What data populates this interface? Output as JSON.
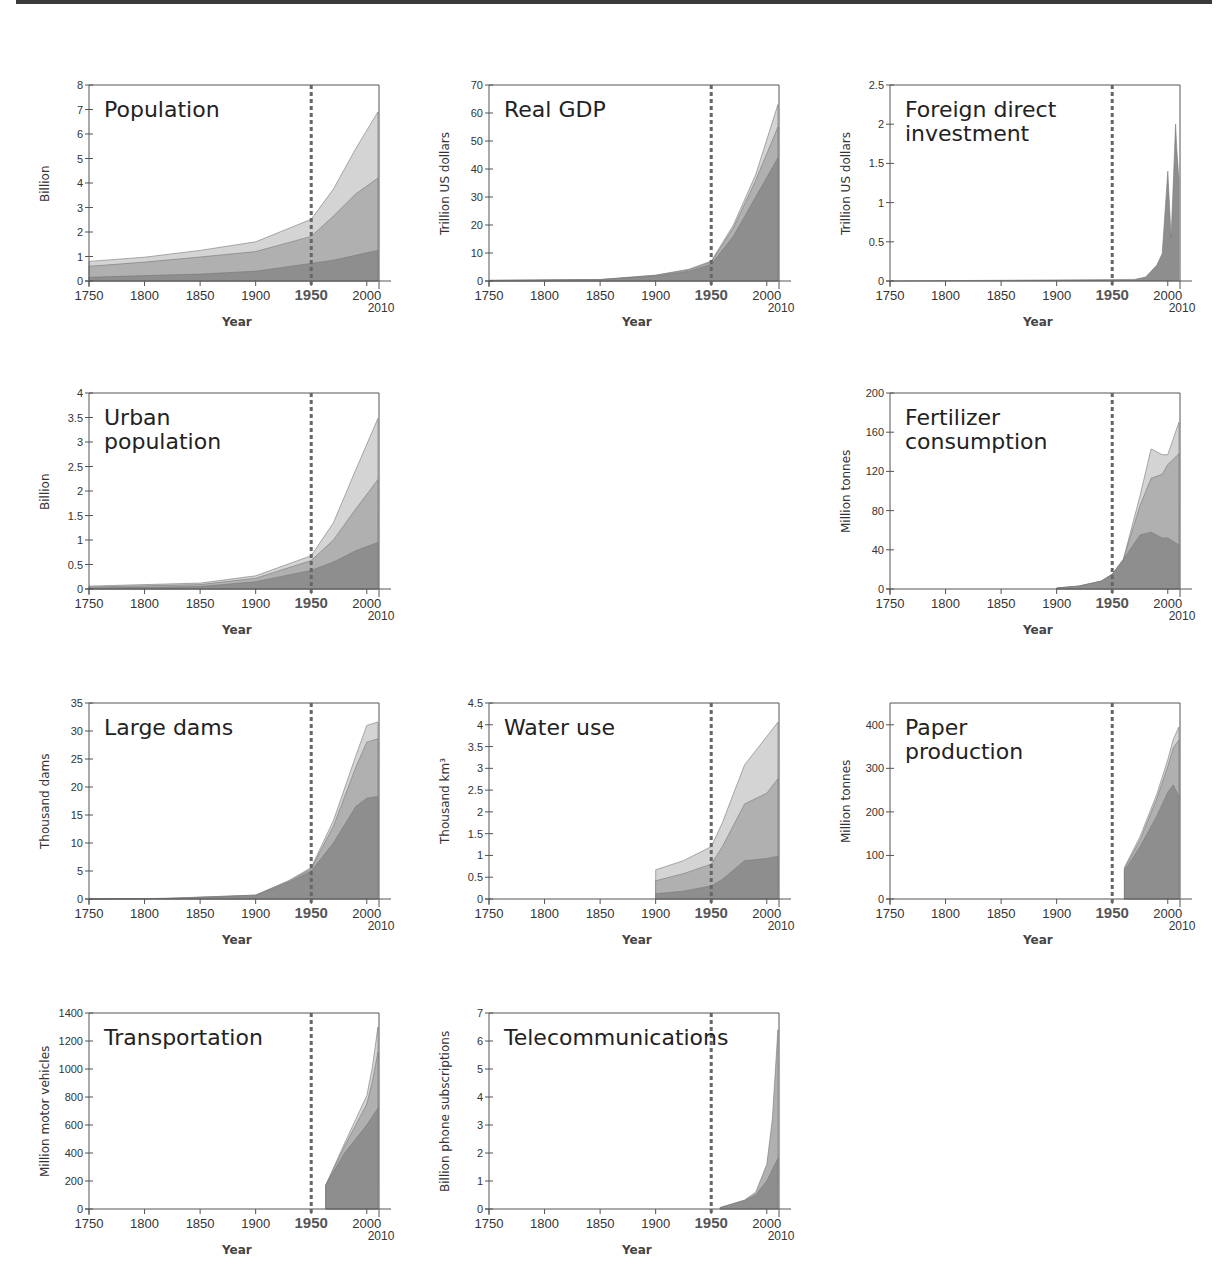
{
  "figure": {
    "colors": {
      "layer_dark": "#8e8e8e",
      "layer_mid": "#b0b0b0",
      "layer_light": "#d4d4d4",
      "axis": "#555555",
      "marker_1950": "#666666",
      "text": "#333333"
    },
    "x_axis": {
      "label": "Year",
      "ticks": [
        "1750",
        "1800",
        "1850",
        "1900",
        "1950",
        "2000"
      ],
      "end_label": "2010",
      "range": [
        1750,
        2010
      ],
      "highlight_year": 1950
    }
  },
  "chart_data": [
    {
      "id": "population",
      "type": "area",
      "stacked": true,
      "title": "Population",
      "xlabel": "Year",
      "ylabel": "Billion",
      "ylim": [
        0,
        8
      ],
      "yticks": [
        "0",
        "1",
        "2",
        "3",
        "4",
        "5",
        "6",
        "7",
        "8"
      ],
      "x": [
        1750,
        1800,
        1850,
        1900,
        1950,
        1970,
        1990,
        2010
      ],
      "series": [
        {
          "name": "layer1",
          "values": [
            0.15,
            0.22,
            0.28,
            0.4,
            0.72,
            0.85,
            1.05,
            1.25
          ]
        },
        {
          "name": "layer2",
          "values": [
            0.45,
            0.55,
            0.7,
            0.8,
            1.1,
            1.8,
            2.5,
            2.95
          ]
        },
        {
          "name": "layer3",
          "values": [
            0.2,
            0.2,
            0.27,
            0.4,
            0.7,
            1.1,
            1.85,
            2.7
          ]
        }
      ],
      "vline": 1950,
      "grid": false
    },
    {
      "id": "real-gdp",
      "type": "area",
      "stacked": true,
      "title": "Real GDP",
      "xlabel": "Year",
      "ylabel": "Trillion US dollars",
      "ylim": [
        0,
        70
      ],
      "yticks": [
        "0",
        "10",
        "20",
        "30",
        "40",
        "50",
        "60",
        "70"
      ],
      "x": [
        1750,
        1850,
        1900,
        1930,
        1950,
        1970,
        1990,
        2010
      ],
      "series": [
        {
          "name": "layer1",
          "values": [
            0.2,
            0.5,
            1.8,
            3.5,
            6,
            16,
            30,
            44
          ]
        },
        {
          "name": "layer2",
          "values": [
            0,
            0,
            0.2,
            0.5,
            0.8,
            3,
            6,
            11
          ]
        },
        {
          "name": "layer3",
          "values": [
            0,
            0,
            0.1,
            0.2,
            0.3,
            1,
            2,
            8
          ]
        }
      ],
      "vline": 1950,
      "grid": false
    },
    {
      "id": "foreign-direct-investment",
      "type": "area",
      "stacked": false,
      "title": "Foreign direct\ninvestment",
      "xlabel": "Year",
      "ylabel": "Trillion US dollars",
      "ylim": [
        0,
        2.5
      ],
      "yticks": [
        "0",
        "0.5",
        "1",
        "1.5",
        "2",
        "2.5"
      ],
      "x": [
        1750,
        1970,
        1980,
        1990,
        1995,
        2000,
        2003,
        2007,
        2008,
        2010
      ],
      "series": [
        {
          "name": "total",
          "values": [
            0,
            0.02,
            0.05,
            0.2,
            0.35,
            1.4,
            0.55,
            2.0,
            1.7,
            1.3
          ]
        }
      ],
      "vline": 1950,
      "grid": false
    },
    {
      "id": "urban-population",
      "type": "area",
      "stacked": true,
      "title": "Urban\npopulation",
      "xlabel": "Year",
      "ylabel": "Billion",
      "ylim": [
        0,
        4
      ],
      "yticks": [
        "0",
        "0.5",
        "1",
        "1.5",
        "2",
        "2.5",
        "3",
        "3.5",
        "4"
      ],
      "x": [
        1750,
        1850,
        1900,
        1950,
        1970,
        1990,
        2010
      ],
      "series": [
        {
          "name": "layer1",
          "values": [
            0.02,
            0.05,
            0.15,
            0.38,
            0.55,
            0.78,
            0.95
          ]
        },
        {
          "name": "layer2",
          "values": [
            0.02,
            0.04,
            0.07,
            0.2,
            0.45,
            0.85,
            1.28
          ]
        },
        {
          "name": "layer3",
          "values": [
            0.02,
            0.03,
            0.05,
            0.1,
            0.35,
            0.8,
            1.25
          ]
        }
      ],
      "vline": 1950,
      "grid": false
    },
    {
      "id": "fertilizer-consumption",
      "type": "area",
      "stacked": true,
      "title": "Fertilizer\nconsumption",
      "xlabel": "Year",
      "ylabel": "Million tonnes",
      "ylim": [
        0,
        200
      ],
      "yticks": [
        "0",
        "40",
        "80",
        "120",
        "160",
        "200"
      ],
      "x": [
        1900,
        1920,
        1940,
        1950,
        1960,
        1975,
        1985,
        1995,
        2000,
        2010
      ],
      "series": [
        {
          "name": "layer1",
          "values": [
            1,
            3,
            8,
            15,
            30,
            55,
            58,
            52,
            52,
            45
          ]
        },
        {
          "name": "layer2",
          "values": [
            0,
            0,
            0,
            0,
            0,
            30,
            55,
            65,
            75,
            93
          ]
        },
        {
          "name": "layer3",
          "values": [
            0,
            0,
            0,
            0,
            0,
            10,
            30,
            20,
            10,
            32
          ]
        }
      ],
      "vline": 1950,
      "grid": false
    },
    {
      "id": "large-dams",
      "type": "area",
      "stacked": true,
      "title": "Large dams",
      "xlabel": "Year",
      "ylabel": "Thousand dams",
      "ylim": [
        0,
        35
      ],
      "yticks": [
        "0",
        "5",
        "10",
        "15",
        "20",
        "25",
        "30",
        "35"
      ],
      "x": [
        1750,
        1820,
        1900,
        1930,
        1950,
        1970,
        1990,
        2000,
        2010
      ],
      "series": [
        {
          "name": "layer1",
          "values": [
            0,
            0.1,
            0.6,
            3,
            5,
            10,
            16.5,
            18,
            18.3
          ]
        },
        {
          "name": "layer2",
          "values": [
            0,
            0,
            0.1,
            0.2,
            0.4,
            3,
            7,
            10,
            10.3
          ]
        },
        {
          "name": "layer3",
          "values": [
            0,
            0,
            0,
            0.1,
            0.2,
            1,
            2,
            3,
            3
          ]
        }
      ],
      "vline": 1950,
      "grid": false
    },
    {
      "id": "water-use",
      "type": "area",
      "stacked": true,
      "title": "Water use",
      "xlabel": "Year",
      "ylabel": "Thousand km³",
      "ylim": [
        0,
        4.5
      ],
      "yticks": [
        "0",
        "0.5",
        "1",
        "1.5",
        "2",
        "2.5",
        "3",
        "3.5",
        "4",
        "4.5"
      ],
      "x": [
        1900,
        1925,
        1950,
        1960,
        1980,
        2000,
        2010
      ],
      "series": [
        {
          "name": "layer1",
          "values": [
            0.12,
            0.18,
            0.3,
            0.45,
            0.88,
            0.93,
            0.98
          ]
        },
        {
          "name": "layer2",
          "values": [
            0.3,
            0.4,
            0.5,
            0.75,
            1.3,
            1.5,
            1.78
          ]
        },
        {
          "name": "layer3",
          "values": [
            0.25,
            0.3,
            0.4,
            0.55,
            0.9,
            1.3,
            1.3
          ]
        }
      ],
      "vline": 1950,
      "grid": false
    },
    {
      "id": "paper-production",
      "type": "area",
      "stacked": true,
      "title": "Paper\nproduction",
      "xlabel": "Year",
      "ylabel": "Million tonnes",
      "ylim": [
        0,
        450
      ],
      "yticks": [
        "0",
        "100",
        "200",
        "300",
        "400"
      ],
      "x": [
        1961,
        1975,
        1990,
        2000,
        2005,
        2010
      ],
      "series": [
        {
          "name": "layer1",
          "values": [
            65,
            120,
            190,
            245,
            262,
            235
          ]
        },
        {
          "name": "layer2",
          "values": [
            5,
            15,
            40,
            60,
            85,
            130
          ]
        },
        {
          "name": "layer3",
          "values": [
            2,
            8,
            10,
            15,
            20,
            30
          ]
        }
      ],
      "vline": 1950,
      "grid": false
    },
    {
      "id": "transportation",
      "type": "area",
      "stacked": true,
      "title": "Transportation",
      "xlabel": "Year",
      "ylabel": "Million motor vehicles",
      "ylim": [
        0,
        1400
      ],
      "yticks": [
        "0",
        "200",
        "400",
        "600",
        "800",
        "1000",
        "1200",
        "1400"
      ],
      "x": [
        1963,
        1980,
        1990,
        2000,
        2005,
        2010
      ],
      "series": [
        {
          "name": "layer1",
          "values": [
            170,
            400,
            500,
            600,
            660,
            720
          ]
        },
        {
          "name": "layer2",
          "values": [
            0,
            50,
            100,
            150,
            250,
            400
          ]
        },
        {
          "name": "layer3",
          "values": [
            0,
            20,
            40,
            60,
            100,
            180
          ]
        }
      ],
      "vline": 1950,
      "grid": false
    },
    {
      "id": "telecommunications",
      "type": "area",
      "stacked": true,
      "title": "Telecommunications",
      "xlabel": "Year",
      "ylabel": "Billion phone subscriptions",
      "ylim": [
        0,
        7
      ],
      "yticks": [
        "0",
        "1",
        "2",
        "3",
        "4",
        "5",
        "6",
        "7"
      ],
      "x": [
        1958,
        1980,
        1990,
        2000,
        2005,
        2010
      ],
      "series": [
        {
          "name": "layer1",
          "values": [
            0.05,
            0.3,
            0.5,
            1.0,
            1.4,
            1.8
          ]
        },
        {
          "name": "layer2",
          "values": [
            0,
            0.02,
            0.1,
            0.6,
            1.8,
            4.6
          ]
        }
      ],
      "vline": 1950,
      "grid": false
    }
  ],
  "layout": {
    "panels": [
      {
        "chart": 0,
        "left": 0,
        "top": 85
      },
      {
        "chart": 1,
        "left": 400,
        "top": 85
      },
      {
        "chart": 2,
        "left": 801,
        "top": 85
      },
      {
        "chart": 3,
        "left": 0,
        "top": 393
      },
      {
        "chart": 4,
        "left": 801,
        "top": 393
      },
      {
        "chart": 5,
        "left": 0,
        "top": 703
      },
      {
        "chart": 6,
        "left": 400,
        "top": 703
      },
      {
        "chart": 7,
        "left": 801,
        "top": 703
      },
      {
        "chart": 8,
        "left": 0,
        "top": 1013
      },
      {
        "chart": 9,
        "left": 400,
        "top": 1013
      }
    ]
  }
}
